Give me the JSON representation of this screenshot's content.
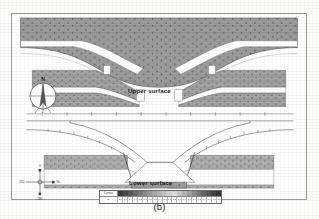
{
  "figure": {
    "caption": "(b)",
    "panels": [
      {
        "id": "upper",
        "label": "Upper surface"
      },
      {
        "id": "lower",
        "label": "Lower surface"
      }
    ]
  },
  "compass": {
    "name": "north-arrow",
    "north_label": "N"
  },
  "orientation_axes": {
    "name": "orientation-cross",
    "top_label": "0",
    "right_label": "90",
    "bottom_label": "180",
    "left_label": "270"
  },
  "colorbar": {
    "legend_label": "Contour",
    "units": "m",
    "tick_labels": [
      "-2.0",
      "-1.8",
      "-1.6",
      "-1.4",
      "-1.2",
      "-1.0",
      "-0.8",
      "-0.6",
      "-0.4",
      "-0.2",
      "0.0",
      "0.2",
      "0.4",
      "0.6",
      "0.8",
      "1.0",
      "1.2",
      "1.4",
      "1.6",
      "1.8",
      "2.0"
    ],
    "swatches": [
      "#3b3b3b",
      "#4a4a4a",
      "#5a5a5a",
      "#6a6a6a",
      "#7a7a7a",
      "#8a8a8a",
      "#9a9a9a",
      "#a8a8a8",
      "#b6b6b6",
      "#c4c4c4",
      "#d2d2d2",
      "#dedede",
      "#c8c8c8",
      "#b4b4b4",
      "#a0a0a0",
      "#8c8c8c",
      "#787878",
      "#646464",
      "#545454",
      "#444444",
      "#343434"
    ]
  },
  "chart_data": {
    "type": "heatmap",
    "title": "(b)",
    "subtitle": "",
    "xlabel": "",
    "ylabel": "",
    "grid": false,
    "legend_position": "bottom-center",
    "colormap": "grayscale-discrete",
    "panels": [
      {
        "name": "Upper surface",
        "description": "Filled grayscale contour map of the upper surface; a broad V-shaped / valley depression runs across the centre with flanking plateau shelves at left and right.",
        "x": [
          0,
          10,
          20,
          30,
          40,
          50,
          60,
          70,
          80,
          90,
          100
        ],
        "profile_top_edge": [
          0.0,
          0.05,
          0.1,
          0.15,
          0.2,
          0.25,
          0.2,
          0.15,
          0.1,
          0.05,
          0.0
        ],
        "profile_valley_floor": [
          1.9,
          1.6,
          1.1,
          0.3,
          -0.6,
          -1.4,
          -0.6,
          0.3,
          1.1,
          1.6,
          1.9
        ],
        "zlim": [
          -2.0,
          2.0
        ]
      },
      {
        "name": "Lower surface",
        "description": "Line contour map of the lower surface; nested open contours sweep down from the left and right margins toward a flat central basin.",
        "x": [
          0,
          10,
          20,
          30,
          40,
          50,
          60,
          70,
          80,
          90,
          100
        ],
        "profile_top_edge": [
          0.9,
          0.85,
          0.8,
          0.6,
          0.2,
          0.0,
          0.2,
          0.6,
          0.8,
          0.85,
          0.9
        ],
        "profile_valley_floor": [
          1.8,
          1.5,
          1.0,
          0.2,
          -0.8,
          -1.6,
          -0.8,
          0.2,
          1.0,
          1.5,
          1.8
        ],
        "zlim": [
          -2.0,
          2.0
        ]
      }
    ]
  }
}
